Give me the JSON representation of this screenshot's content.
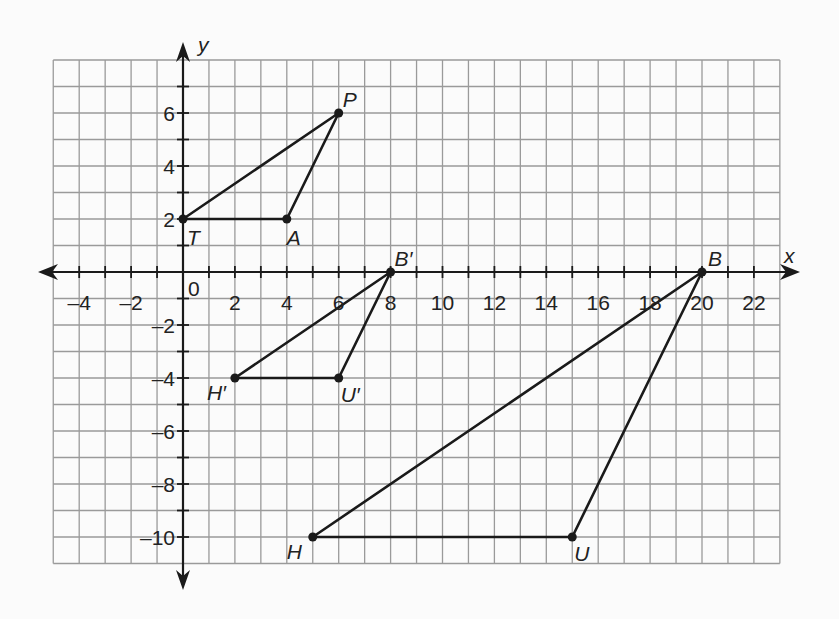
{
  "chart_data": {
    "type": "coordinate-plane",
    "title": "",
    "xlabel": "x",
    "ylabel": "y",
    "grid": true,
    "xlim": [
      -5,
      23
    ],
    "ylim": [
      -11,
      8
    ],
    "x_tick_labels": [
      "-4",
      "-2",
      "0",
      "2",
      "4",
      "6",
      "8",
      "10",
      "12",
      "14",
      "16",
      "18",
      "20",
      "22"
    ],
    "x_tick_values": [
      -4,
      -2,
      0,
      2,
      4,
      6,
      8,
      10,
      12,
      14,
      16,
      18,
      20,
      22
    ],
    "y_tick_labels": [
      "6",
      "4",
      "2",
      "-2",
      "-4",
      "-6",
      "-8",
      "-10"
    ],
    "y_tick_values": [
      6,
      4,
      2,
      -2,
      -4,
      -6,
      -8,
      -10
    ],
    "shapes": [
      {
        "name": "Triangle TAP",
        "vertices": [
          {
            "label": "T",
            "x": 0,
            "y": 2
          },
          {
            "label": "A",
            "x": 4,
            "y": 2
          },
          {
            "label": "P",
            "x": 6,
            "y": 6
          }
        ]
      },
      {
        "name": "Triangle H'U'B'",
        "vertices": [
          {
            "label": "H′",
            "x": 2,
            "y": -4
          },
          {
            "label": "U′",
            "x": 6,
            "y": -4
          },
          {
            "label": "B′",
            "x": 8,
            "y": 0
          }
        ]
      },
      {
        "name": "Triangle HUB",
        "vertices": [
          {
            "label": "H",
            "x": 5,
            "y": -10
          },
          {
            "label": "U",
            "x": 15,
            "y": -10
          },
          {
            "label": "B",
            "x": 20,
            "y": 0
          }
        ]
      }
    ]
  },
  "colors": {
    "grid": "#9a9a9a",
    "axis": "#1a1a1a",
    "shape": "#1a1a1a",
    "background": "#fbfbfb"
  }
}
